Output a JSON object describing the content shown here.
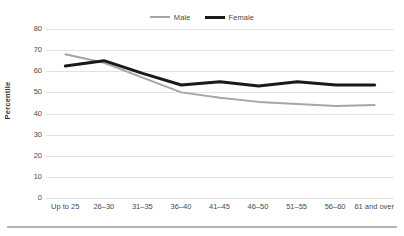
{
  "chart_data": {
    "type": "line",
    "title": "",
    "subtitle": "",
    "xlabel": "",
    "ylabel": "Percentile",
    "ylim": [
      0,
      80
    ],
    "yticks": [
      0,
      10,
      20,
      30,
      40,
      50,
      60,
      70,
      80
    ],
    "grid": "horizontal",
    "legend_position": "top-center",
    "categories": [
      "Up to 25",
      "26–30",
      "31–35",
      "36–40",
      "41–45",
      "46–50",
      "51–55",
      "56–60",
      "61 and over"
    ],
    "series": [
      {
        "name": "Male",
        "color": "#a6a6a6",
        "line_width": 2,
        "values": [
          68,
          64,
          57,
          50,
          47.5,
          45.5,
          44.5,
          43.5,
          44
        ]
      },
      {
        "name": "Female",
        "color": "#1a1a1a",
        "line_width": 3,
        "values": [
          62.5,
          65,
          59,
          53.5,
          55,
          53,
          55,
          53.5,
          53.5
        ]
      }
    ]
  },
  "legend": {
    "entries": [
      {
        "label": "Male"
      },
      {
        "label": "Female"
      }
    ]
  },
  "axes": {
    "y_title": "Percentile",
    "y_tick_labels": [
      "80",
      "70",
      "60",
      "50",
      "40",
      "30",
      "20",
      "10",
      "0"
    ],
    "x_tick_labels": [
      "Up to 25",
      "26–30",
      "31–35",
      "36–40",
      "41–45",
      "46–50",
      "51–55",
      "56–60",
      "61 and over"
    ]
  },
  "colors": {
    "male_line": "#a6a6a6",
    "female_line": "#1a1a1a",
    "gridline": "#e2e2e2",
    "text": "#4a4a4a",
    "bottom_rule": "#b5b5b5",
    "background": "#ffffff"
  }
}
